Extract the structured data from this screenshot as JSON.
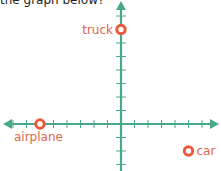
{
  "question": {
    "text": "the graph below?"
  },
  "graph": {
    "axis_color": "#4aa88a",
    "point_color": "#ea5a3a",
    "label_color": "#e0674c",
    "origin_px": [
      121,
      124
    ],
    "unit_px": 13.5,
    "x_range": [
      -8,
      6
    ],
    "y_range": [
      -3,
      8
    ],
    "points": [
      {
        "label": "truck",
        "x": 0,
        "y": 7
      },
      {
        "label": "airplane",
        "x": -6,
        "y": 0
      },
      {
        "label": "car",
        "x": 5,
        "y": -2
      }
    ]
  }
}
